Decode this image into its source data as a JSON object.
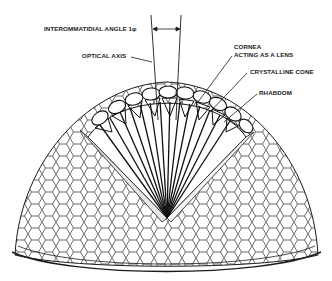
{
  "diagram": {
    "labels": {
      "interommatidial_angle": "INTEROMMATIDIAL ANGLE 1φ",
      "optical_axis": "OPTICAL AXIS",
      "cornea_line1": "CORNEA",
      "cornea_line2": "ACTING AS A LENS",
      "crystalline_cone": "CRYSTALLINE CONE",
      "rhabdom": "RHABDOM"
    },
    "colors": {
      "ink": "#1a1a1a",
      "background": "#ffffff"
    }
  }
}
